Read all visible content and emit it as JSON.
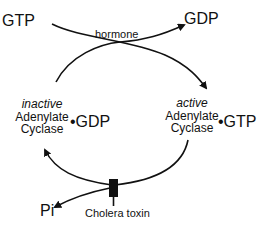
{
  "diagram": {
    "top_left_label": "GTP",
    "top_right_label": "GDP",
    "hormone_label": "hormone",
    "inactive_state": {
      "qualifier": "inactive",
      "line1": "Adenylate",
      "line2": "Cyclase",
      "bound": "GDP",
      "bullet": "•"
    },
    "active_state": {
      "qualifier": "active",
      "line1": "Adenylate",
      "line2": "Cyclase",
      "bound": "GTP",
      "bullet": "•"
    },
    "phosphate_label": "Pi",
    "toxin_label": "Cholera toxin",
    "colors": {
      "ink": "#111111",
      "background": "#ffffff"
    }
  }
}
